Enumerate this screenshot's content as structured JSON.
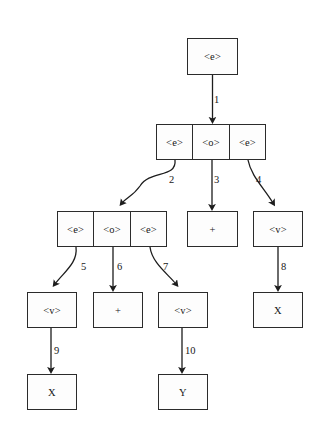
{
  "diagram": {
    "background_color": "#ffffff",
    "stroke_color": "#2b2b2b",
    "nodes": [
      {
        "id": "n-root",
        "name": "node-root-e",
        "x": 187,
        "y": 38,
        "w": 51,
        "h": 37,
        "cells": [
          {
            "label": "<e>"
          }
        ]
      },
      {
        "id": "n-l2",
        "name": "node-level2-e-o-e",
        "x": 156,
        "y": 124,
        "w": 110,
        "h": 36,
        "cells": [
          {
            "label": "<e>"
          },
          {
            "label": "<o>"
          },
          {
            "label": "<e>"
          }
        ]
      },
      {
        "id": "n-l3-left",
        "name": "node-level3-e-o-e",
        "x": 57,
        "y": 211,
        "w": 110,
        "h": 36,
        "cells": [
          {
            "label": "<e>"
          },
          {
            "label": "<o>"
          },
          {
            "label": "<e>"
          }
        ]
      },
      {
        "id": "n-l3-plus",
        "name": "node-level3-plus",
        "x": 187,
        "y": 211,
        "w": 51,
        "h": 36,
        "cells": [
          {
            "label": "+"
          }
        ]
      },
      {
        "id": "n-l3-v",
        "name": "node-level3-v",
        "x": 253,
        "y": 211,
        "w": 50,
        "h": 36,
        "cells": [
          {
            "label": "<v>"
          }
        ]
      },
      {
        "id": "n-l4-v1",
        "name": "node-level4-v-left",
        "x": 27,
        "y": 292,
        "w": 50,
        "h": 36,
        "cells": [
          {
            "label": "<v>"
          }
        ]
      },
      {
        "id": "n-l4-plus",
        "name": "node-level4-plus",
        "x": 93,
        "y": 292,
        "w": 50,
        "h": 36,
        "cells": [
          {
            "label": "+"
          }
        ]
      },
      {
        "id": "n-l4-v2",
        "name": "node-level4-v-right",
        "x": 158,
        "y": 292,
        "w": 50,
        "h": 36,
        "cells": [
          {
            "label": "<v>"
          }
        ]
      },
      {
        "id": "n-l4-x",
        "name": "node-level4-x",
        "x": 253,
        "y": 292,
        "w": 50,
        "h": 36,
        "cells": [
          {
            "label": "X"
          }
        ]
      },
      {
        "id": "n-l5-x",
        "name": "node-level5-x",
        "x": 27,
        "y": 374,
        "w": 50,
        "h": 36,
        "cells": [
          {
            "label": "X"
          }
        ]
      },
      {
        "id": "n-l5-y",
        "name": "node-level5-y",
        "x": 158,
        "y": 374,
        "w": 50,
        "h": 36,
        "cells": [
          {
            "label": "Y"
          }
        ]
      }
    ],
    "edges": [
      {
        "id": "e1",
        "label": "1",
        "name": "edge-1",
        "from": "n-root",
        "to": "n-l2",
        "path": "M 212.5 75 L 212.5 120",
        "label_x": 214,
        "label_y": 94
      },
      {
        "id": "e2",
        "label": "2",
        "name": "edge-2",
        "from": "n-l2",
        "to": "n-l3-left",
        "path": "M 175 160 C 177 178 150 170 140 186 C 133 196 126 198 122 203",
        "label_x": 169,
        "label_y": 174
      },
      {
        "id": "e3",
        "label": "3",
        "name": "edge-3",
        "from": "n-l2",
        "to": "n-l3-plus",
        "path": "M 212 160 L 212 207",
        "label_x": 214,
        "label_y": 174
      },
      {
        "id": "e4",
        "label": "4",
        "name": "edge-4",
        "from": "n-l2",
        "to": "n-l3-v",
        "path": "M 248 160 C 251 176 264 188 273 203",
        "label_x": 256,
        "label_y": 174
      },
      {
        "id": "e5",
        "label": "5",
        "name": "edge-5",
        "from": "n-l3-left",
        "to": "n-l4-v1",
        "path": "M 76 247 C 78 263 64 272 55 284",
        "label_x": 81,
        "label_y": 261
      },
      {
        "id": "e6",
        "label": "6",
        "name": "edge-6",
        "from": "n-l3-left",
        "to": "n-l4-plus",
        "path": "M 113 247 L 113 288",
        "label_x": 117,
        "label_y": 261
      },
      {
        "id": "e7",
        "label": "7",
        "name": "edge-7",
        "from": "n-l3-left",
        "to": "n-l4-v2",
        "path": "M 150 247 C 152 263 168 274 176 284",
        "label_x": 163,
        "label_y": 261
      },
      {
        "id": "e8",
        "label": "8",
        "name": "edge-8",
        "from": "n-l3-v",
        "to": "n-l4-x",
        "path": "M 278 247 L 278 288",
        "label_x": 281,
        "label_y": 261
      },
      {
        "id": "e9",
        "label": "9",
        "name": "edge-9",
        "from": "n-l4-v1",
        "to": "n-l5-x",
        "path": "M 51 328 L 51 370",
        "label_x": 54,
        "label_y": 345
      },
      {
        "id": "e10",
        "label": "10",
        "name": "edge-10",
        "from": "n-l4-v2",
        "to": "n-l5-y",
        "path": "M 182 328 L 182 370",
        "label_x": 185,
        "label_y": 345
      }
    ]
  }
}
